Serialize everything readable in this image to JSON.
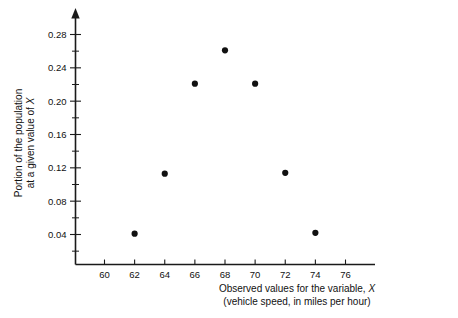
{
  "chart_data": {
    "type": "scatter",
    "title": "",
    "xlabel": "Observed values for the variable, X",
    "xlabel_line1": "Observed values for the variable,",
    "xlabel_line1_italic": "X",
    "xlabel_line2": "(vehicle speed, in miles per hour)",
    "ylabel": "Portion of the population at a given value of X",
    "ylabel_line1": "Portion of the population",
    "ylabel_line2": "at a given value of",
    "ylabel_line2_italic": "X",
    "x": [
      62,
      64,
      66,
      68,
      70,
      72,
      74
    ],
    "values": [
      0.041,
      0.113,
      0.221,
      0.261,
      0.221,
      0.114,
      0.042
    ],
    "points": [
      {
        "x": 62,
        "y": 0.041
      },
      {
        "x": 64,
        "y": 0.113
      },
      {
        "x": 66,
        "y": 0.221
      },
      {
        "x": 68,
        "y": 0.261
      },
      {
        "x": 70,
        "y": 0.221
      },
      {
        "x": 72,
        "y": 0.114
      },
      {
        "x": 74,
        "y": 0.042
      }
    ],
    "xlim": [
      58.6,
      77.0
    ],
    "ylim": [
      0.0,
      0.305
    ],
    "xticks": [
      60,
      62,
      64,
      66,
      68,
      70,
      72,
      74,
      76
    ],
    "xtick_labels": [
      "60",
      "62",
      "64",
      "66",
      "68",
      "70",
      "72",
      "74",
      "76"
    ],
    "yticks": [
      0.04,
      0.08,
      0.12,
      0.16,
      0.2,
      0.24,
      0.28
    ],
    "ytick_labels": [
      "0.04",
      "0.08",
      "0.12",
      "0.16",
      "0.20",
      "0.24",
      "0.28"
    ],
    "y_minor_ticks": [
      0.02,
      0.06,
      0.1,
      0.14,
      0.18,
      0.22,
      0.26,
      0.3
    ],
    "grid": false,
    "legend": null,
    "point_color": "#111111",
    "axis_color": "#1a1a1a",
    "background_color": "#ffffff",
    "y_axis_has_arrow": true
  }
}
